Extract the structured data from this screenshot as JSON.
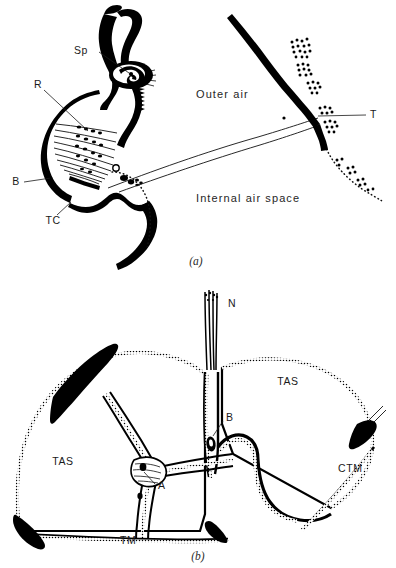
{
  "figure": {
    "background_color": "#ffffff",
    "ink_color": "#000000",
    "panels": [
      {
        "id": "a",
        "caption": "(a)",
        "region_labels": [
          {
            "name": "outer-air",
            "text": "Outer air",
            "x": 196,
            "y": 95
          },
          {
            "name": "internal-air-space",
            "text": "Internal air space",
            "x": 196,
            "y": 199
          }
        ],
        "structure_labels": [
          {
            "name": "spiracle",
            "text": "Sp",
            "x": 88,
            "y": 51
          },
          {
            "name": "receptor",
            "text": "R",
            "x": 38,
            "y": 85
          },
          {
            "name": "b-structure",
            "text": "B",
            "x": 16,
            "y": 182
          },
          {
            "name": "tracheal-cuticle",
            "text": "TC",
            "x": 53,
            "y": 221
          },
          {
            "name": "trachea",
            "text": "T",
            "x": 370,
            "y": 115
          }
        ]
      },
      {
        "id": "b",
        "caption": "(b)",
        "region_labels": [
          {
            "name": "tracheal-air-space-right",
            "text": "TAS",
            "x": 288,
            "y": 382
          },
          {
            "name": "tracheal-air-space-left",
            "text": "TAS",
            "x": 63,
            "y": 462
          }
        ],
        "structure_labels": [
          {
            "name": "nerve",
            "text": "N",
            "x": 228,
            "y": 304
          },
          {
            "name": "b-structure",
            "text": "B",
            "x": 226,
            "y": 418
          },
          {
            "name": "a-structure",
            "text": "A",
            "x": 158,
            "y": 486
          },
          {
            "name": "connective-tissue-membrane",
            "text": "CTM",
            "x": 338,
            "y": 469
          },
          {
            "name": "tracheal-membrane",
            "text": "TM",
            "x": 120,
            "y": 541
          }
        ]
      }
    ]
  }
}
